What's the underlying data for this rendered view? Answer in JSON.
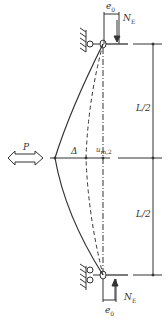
{
  "diagram": {
    "labels": {
      "e0_top": "e",
      "e0_top_sub": "0",
      "NE_top": "N",
      "NE_top_sub": "E",
      "L_half_top": "L/2",
      "L_half_bottom": "L/2",
      "P": "P",
      "Delta": "Δ",
      "um": "u",
      "um_sub": "m,2",
      "NE_bottom": "N",
      "NE_bottom_sub": "E",
      "e0_bottom": "e",
      "e0_bottom_sub": "0"
    },
    "colors": {
      "line": "#333333",
      "background": "#ffffff"
    }
  }
}
